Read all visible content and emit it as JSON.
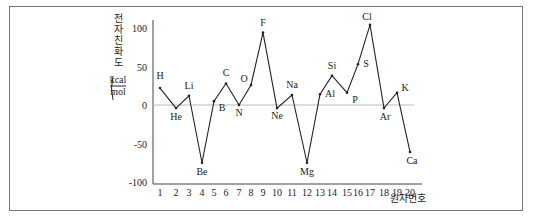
{
  "chart_data": {
    "type": "line",
    "title": "",
    "xlabel": "원자번호",
    "ylabel": "전자 친화도 (kcal/mol)",
    "ylabel_chars": [
      "전",
      "자",
      "친",
      "화",
      "도"
    ],
    "ylabel_unit_top": "kcal",
    "ylabel_unit_bottom": "mol",
    "ylim": [
      -100,
      100
    ],
    "yticks": [
      100,
      50,
      0,
      -50,
      -100
    ],
    "ytick_labels": [
      "100",
      "50",
      "0",
      "-50",
      "-100"
    ],
    "x": [
      1,
      2,
      3,
      4,
      5,
      6,
      7,
      8,
      9,
      10,
      11,
      12,
      13,
      14,
      15,
      16,
      17,
      18,
      19,
      20
    ],
    "xtick_labels": [
      "1",
      "2",
      "3",
      "4",
      "5",
      "6",
      "7",
      "8",
      "9",
      "10",
      "11",
      "12",
      "13",
      "14",
      "15",
      "16",
      "17",
      "18",
      "19",
      "20"
    ],
    "series": [
      {
        "name": "전자 친화도",
        "elements": [
          "H",
          "He",
          "Li",
          "Be",
          "B",
          "C",
          "N",
          "O",
          "F",
          "Ne",
          "Na",
          "Mg",
          "Al",
          "Si",
          "P",
          "S",
          "Cl",
          "Ar",
          "K",
          "Ca"
        ],
        "values": [
          22,
          -4,
          12,
          -75,
          5,
          28,
          0,
          26,
          94,
          -4,
          13,
          -75,
          14,
          38,
          16,
          53,
          104,
          -4,
          16,
          -61
        ]
      }
    ],
    "grid": false,
    "legend": null,
    "reference_line": 0
  }
}
